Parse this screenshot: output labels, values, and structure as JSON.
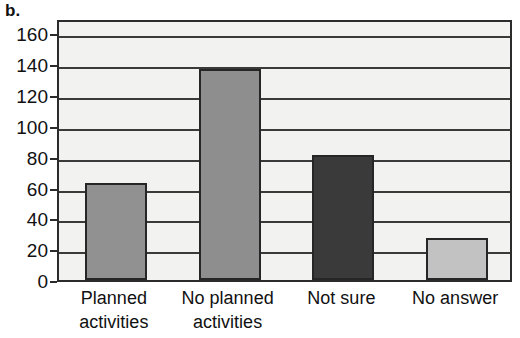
{
  "panel": {
    "label": "b."
  },
  "chart_data": {
    "type": "bar",
    "title": "",
    "subtitle": "",
    "xlabel": "",
    "ylabel": "",
    "categories": [
      "Planned\nactivities",
      "No planned\nactivities",
      "Not sure",
      "No answer"
    ],
    "category_lines": [
      [
        "Planned",
        "activities"
      ],
      [
        "No planned",
        "activities"
      ],
      [
        "Not sure",
        ""
      ],
      [
        "No answer",
        ""
      ]
    ],
    "values": [
      63,
      137,
      81,
      27
    ],
    "bar_colors": [
      "#919191",
      "#8e8e8e",
      "#3a3a3a",
      "#c2c2c2"
    ],
    "bar_edge_color": "#262626",
    "ylim": [
      0,
      170
    ],
    "yticks": [
      0,
      20,
      40,
      60,
      80,
      100,
      120,
      140,
      160
    ],
    "ytick_labels": [
      "0",
      "20",
      "40",
      "60",
      "80",
      "100",
      "120",
      "140",
      "160"
    ],
    "grid": true,
    "grid_color": "#3a3a3a",
    "legend": "none",
    "plot_background": "#f2f2f0",
    "axis_color": "#2b2b2b"
  }
}
